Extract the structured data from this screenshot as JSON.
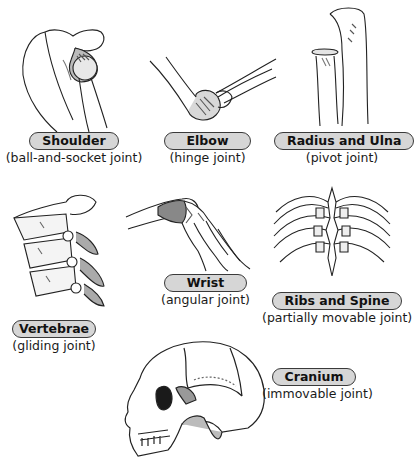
{
  "diagram": {
    "joints": [
      {
        "name": "Shoulder",
        "type": "(ball-and-socket joint)",
        "icon": "shoulder-joint-illustration"
      },
      {
        "name": "Elbow",
        "type": "(hinge joint)",
        "icon": "elbow-joint-illustration"
      },
      {
        "name": "Radius and Ulna",
        "type": "(pivot joint)",
        "icon": "radius-ulna-illustration"
      },
      {
        "name": "Vertebrae",
        "type": "(gliding joint)",
        "icon": "vertebrae-illustration"
      },
      {
        "name": "Wrist",
        "type": "(angular joint)",
        "icon": "wrist-illustration"
      },
      {
        "name": "Ribs and Spine",
        "type": "(partially movable joint)",
        "icon": "ribs-spine-illustration"
      },
      {
        "name": "Cranium",
        "type": "(immovable joint)",
        "icon": "skull-illustration"
      }
    ],
    "colors": {
      "label_fill": "#d6d6d6",
      "label_border": "#3a3a3a",
      "line": "#222222",
      "shade": "#9a9a9a"
    }
  }
}
